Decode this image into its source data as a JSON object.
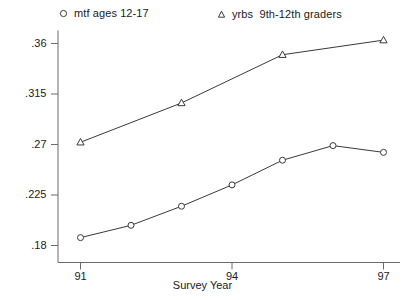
{
  "chart_data": {
    "type": "line",
    "title": "",
    "xlabel": "Survey Year",
    "ylabel": "",
    "x": [
      91,
      92,
      93,
      94,
      95,
      96,
      97
    ],
    "xlim": [
      91,
      97
    ],
    "ylim": [
      0.18,
      0.3665
    ],
    "grid": false,
    "legend_position": "top",
    "xticks": [
      "91",
      "94",
      "97"
    ],
    "xtick_values": [
      91,
      94,
      97
    ],
    "yticks": [
      ".18",
      ".225",
      ".27",
      ".315",
      ".36"
    ],
    "ytick_values": [
      0.18,
      0.225,
      0.27,
      0.315,
      0.36
    ],
    "series": [
      {
        "name": "mtf ages 12-17",
        "marker": "circle",
        "x": [
          91,
          92,
          93,
          94,
          95,
          96,
          97
        ],
        "values": [
          0.187,
          0.198,
          0.215,
          0.234,
          0.256,
          0.269,
          0.263
        ]
      },
      {
        "name": "yrbs  9th-12th graders",
        "marker": "triangle",
        "x": [
          91,
          93,
          95,
          97
        ],
        "values": [
          0.272,
          0.307,
          0.35,
          0.363
        ]
      }
    ]
  },
  "legend": {
    "items": [
      {
        "marker": "circle-marker-icon",
        "label": "mtf ages 12-17"
      },
      {
        "marker": "triangle-marker-icon",
        "label_a": "yrbs",
        "label_b": "9th-12th graders"
      }
    ]
  },
  "axes": {
    "x_title": "Survey Year"
  },
  "colors": {
    "line": "#3a3a3a",
    "axis": "#6b6b6b",
    "text": "#1a1a1a",
    "background": "#ffffff"
  }
}
